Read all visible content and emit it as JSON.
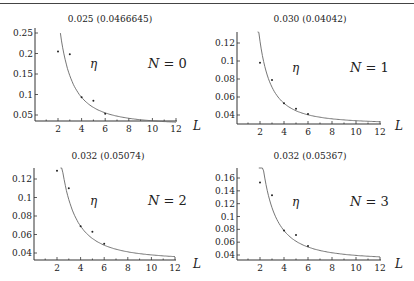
{
  "chart_data": [
    {
      "type": "scatter",
      "title": "0.025 (0.0466645)",
      "annotation": "η",
      "label": "N = 0",
      "xlabel": "L",
      "ylabel": "",
      "x_ticks": [
        2,
        4,
        6,
        8,
        10,
        12
      ],
      "y_ticks": [
        0.05,
        0.1,
        0.15,
        0.2,
        0.25
      ],
      "y_tick_labels": [
        "0.05",
        "0.1",
        "0.15",
        "0.2",
        "0.25"
      ],
      "xlim": [
        0,
        12
      ],
      "ylim": [
        0.035,
        0.27
      ],
      "points": {
        "x": [
          2,
          3,
          4,
          5,
          6
        ],
        "y": [
          0.205,
          0.198,
          0.093,
          0.085,
          0.053
        ]
      },
      "fit_curve": {
        "asymptote": 0.025,
        "x_start": 2.2
      }
    },
    {
      "type": "scatter",
      "title": "0.030 (0.04042)",
      "annotation": "η",
      "label": "N = 1",
      "xlabel": "L",
      "ylabel": "",
      "x_ticks": [
        2,
        4,
        6,
        8,
        10,
        12
      ],
      "y_ticks": [
        0.04,
        0.06,
        0.08,
        0.1,
        0.12
      ],
      "y_tick_labels": [
        "0.04",
        "0.06",
        "0.08",
        "0.1",
        "0.12"
      ],
      "xlim": [
        0,
        12
      ],
      "ylim": [
        0.03,
        0.13
      ],
      "points": {
        "x": [
          2,
          3,
          4,
          5,
          6
        ],
        "y": [
          0.098,
          0.079,
          0.053,
          0.047,
          0.041
        ]
      },
      "fit_curve": {
        "asymptote": 0.03,
        "x_start": 1.8
      }
    },
    {
      "type": "scatter",
      "title": "0.032 (0.05074)",
      "annotation": "η",
      "label": "N = 2",
      "xlabel": "L",
      "ylabel": "",
      "x_ticks": [
        2,
        4,
        6,
        8,
        10,
        12
      ],
      "y_ticks": [
        0.04,
        0.06,
        0.08,
        0.1,
        0.12
      ],
      "y_tick_labels": [
        "0.04",
        "0.06",
        "0.08",
        "0.1",
        "0.12"
      ],
      "xlim": [
        0,
        12
      ],
      "ylim": [
        0.034,
        0.13
      ],
      "points": {
        "x": [
          2,
          3,
          4,
          5,
          6
        ],
        "y": [
          0.129,
          0.11,
          0.069,
          0.063,
          0.05
        ]
      },
      "fit_curve": {
        "asymptote": 0.032,
        "x_start": 2.3
      }
    },
    {
      "type": "scatter",
      "title": "0.032 (0.05367)",
      "annotation": "η",
      "label": "N = 3",
      "xlabel": "L",
      "ylabel": "",
      "x_ticks": [
        2,
        4,
        6,
        8,
        10,
        12
      ],
      "y_ticks": [
        0.04,
        0.06,
        0.08,
        0.1,
        0.12,
        0.14,
        0.16
      ],
      "y_tick_labels": [
        "0.04",
        "0.06",
        "0.08",
        "0.1",
        "0.12",
        "0.14",
        "0.16"
      ],
      "xlim": [
        0,
        12
      ],
      "ylim": [
        0.035,
        0.175
      ],
      "points": {
        "x": [
          2,
          3,
          4,
          5,
          6
        ],
        "y": [
          0.153,
          0.133,
          0.078,
          0.071,
          0.054
        ]
      },
      "fit_curve": {
        "asymptote": 0.032,
        "x_start": 1.9
      }
    }
  ],
  "panels": [
    {
      "title": "0.025 (0.0466645)",
      "eta": "η",
      "n_label": "N = 0",
      "L": "L"
    },
    {
      "title": "0.030 (0.04042)",
      "eta": "η",
      "n_label": "N = 1",
      "L": "L"
    },
    {
      "title": "0.032 (0.05074)",
      "eta": "η",
      "n_label": "N = 2",
      "L": "L"
    },
    {
      "title": "0.032 (0.05367)",
      "eta": "η",
      "n_label": "N = 3",
      "L": "L"
    }
  ],
  "colors": {
    "axis": "#333333",
    "curve": "#666666",
    "points": "#222222",
    "text": "#222222"
  }
}
